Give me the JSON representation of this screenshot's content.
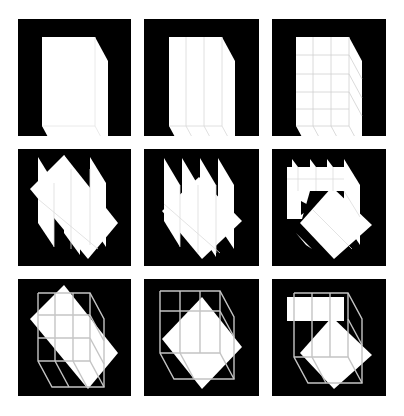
{
  "figure": {
    "layout": {
      "rows": 3,
      "cols": 3
    },
    "background": "#ffffff",
    "panel_background": "#000000",
    "shape_color": "#ffffff",
    "grid_line_color": "#c8c8c8",
    "panels": [
      {
        "row": 1,
        "col": 1,
        "description": "solid cube, no subdivision"
      },
      {
        "row": 1,
        "col": 2,
        "description": "cube subdivided into 3 vertical slabs"
      },
      {
        "row": 1,
        "col": 3,
        "description": "cube subdivided into 3x3 grid"
      },
      {
        "row": 2,
        "col": 1,
        "description": "rotated slabs fanned apart"
      },
      {
        "row": 2,
        "col": 2,
        "description": "rotated slabs, shifted variant"
      },
      {
        "row": 2,
        "col": 3,
        "description": "rotated slabs with top block"
      },
      {
        "row": 3,
        "col": 1,
        "description": "rotated slabs with wireframe cube overlay"
      },
      {
        "row": 3,
        "col": 2,
        "description": "rotated slabs with wireframe cube overlay, shifted"
      },
      {
        "row": 3,
        "col": 3,
        "description": "rotated slabs with top block and wireframe overlay"
      }
    ]
  }
}
